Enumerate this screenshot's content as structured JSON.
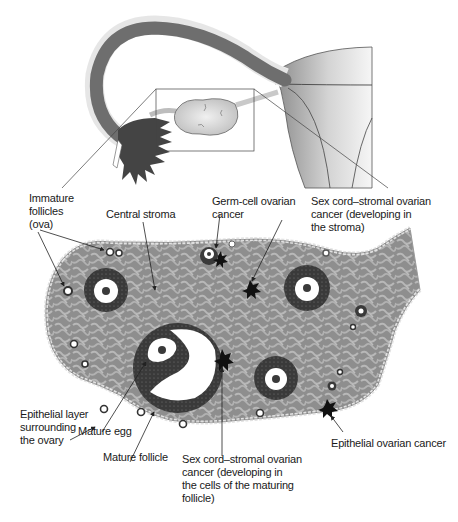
{
  "diagram": {
    "colors": {
      "stroma_dark": "#8a8a8a",
      "stroma_light": "#b4b4b4",
      "follicle_ring": "#3a3a3a",
      "tube": "#6e6e6e",
      "uterus_light": "#e6e6e6",
      "cancer": "#111111",
      "epithelium": "#d8d8d8"
    },
    "labels": {
      "immature_follicles": "Immature\nfollicles\n(ova)",
      "central_stroma": "Central stroma",
      "germ_cell_cancer": "Germ-cell ovarian\ncancer",
      "stromal_cancer_stroma": "Sex cord–stromal ovarian\ncancer (developing in\nthe stroma)",
      "epithelial_layer": "Epithelial layer\nsurrounding\nthe ovary",
      "mature_egg": "Mature egg",
      "mature_follicle": "Mature follicle",
      "stromal_cancer_follicle": "Sex cord–stromal ovarian\ncancer (developing in\nthe cells of the maturing\nfollicle)",
      "epithelial_cancer": "Epithelial ovarian cancer"
    },
    "structures": [
      "fallopian-tube",
      "fimbriae",
      "ovary",
      "uterus",
      "zoom-box",
      "ovary-cross-section"
    ]
  }
}
